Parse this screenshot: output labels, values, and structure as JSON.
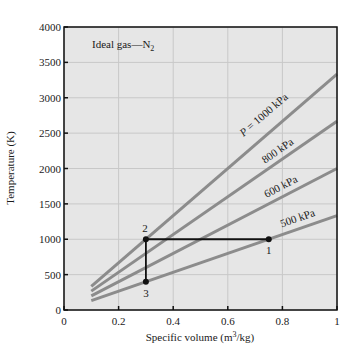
{
  "chart_data": {
    "type": "line",
    "title": "Ideal gas—N",
    "title_subscript": "2",
    "xlabel": "Specific volume (m",
    "xlabel_sup": "3",
    "xlabel_tail": "/kg)",
    "ylabel": "Temperature (K)",
    "xlim": [
      0,
      1
    ],
    "ylim": [
      0,
      4000
    ],
    "x_ticks": [
      0,
      0.2,
      0.4,
      0.6,
      0.8,
      1
    ],
    "x_tick_labels": [
      "0",
      "0.2",
      "0.4",
      "0.6",
      "0.8",
      "1"
    ],
    "y_ticks": [
      0,
      500,
      1000,
      1500,
      2000,
      2500,
      3000,
      3500,
      4000
    ],
    "y_tick_labels": [
      "0",
      "500",
      "1000",
      "1500",
      "2000",
      "2500",
      "3000",
      "3500",
      "4000"
    ],
    "grid": true,
    "background": "#e6e6e6",
    "gridline_color": "#c8c8c8",
    "isobar_color": "#8c8c8c",
    "process_color": "#111111",
    "series": [
      {
        "name": "P = 1000 kPa",
        "label": "P = 1000 kPa",
        "x": [
          0.1,
          1.0
        ],
        "y": [
          333,
          3333
        ]
      },
      {
        "name": "800 kPa",
        "label": "800 kPa",
        "x": [
          0.1,
          1.0
        ],
        "y": [
          267,
          2667
        ]
      },
      {
        "name": "600 kPa",
        "label": "600 kPa",
        "x": [
          0.1,
          1.0
        ],
        "y": [
          200,
          2000
        ]
      },
      {
        "name": "500 kPa",
        "label": "500 kPa",
        "x": [
          0.1,
          1.0
        ],
        "y": [
          133,
          1333
        ]
      }
    ],
    "process_path": {
      "x": [
        0.75,
        0.3,
        0.3
      ],
      "y": [
        1000,
        1000,
        400
      ]
    },
    "state_points": [
      {
        "label": "1",
        "x": 0.75,
        "y": 1000
      },
      {
        "label": "2",
        "x": 0.3,
        "y": 1000
      },
      {
        "label": "3",
        "x": 0.3,
        "y": 400
      }
    ]
  }
}
